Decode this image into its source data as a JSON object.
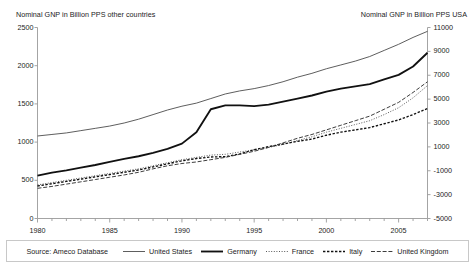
{
  "titles": {
    "left": "Nominal GNP in Billion PPS other countries",
    "right": "Nominal GNP in Billion PPS USA"
  },
  "source_label": "Source: Ameco Database",
  "axes": {
    "left_ticks": [
      "2500",
      "2000",
      "1500",
      "1000",
      "500",
      "0"
    ],
    "right_ticks": [
      "11000",
      "9000",
      "7000",
      "5000",
      "3000",
      "1000",
      "-1000",
      "-3000",
      "-5000"
    ],
    "x_ticks": [
      "1980",
      "1985",
      "1990",
      "1995",
      "2000",
      "2005"
    ]
  },
  "legend": [
    {
      "label": "United States",
      "style": "solid-thin"
    },
    {
      "label": "Germany",
      "style": "solid-thick"
    },
    {
      "label": "France",
      "style": "dotted"
    },
    {
      "label": "Italy",
      "style": "dash-dot"
    },
    {
      "label": "United Kingdom",
      "style": "dashed"
    }
  ],
  "chart_data": {
    "type": "line",
    "xlabel": "",
    "ylabel": "Nominal GNP in Billion PPS other countries",
    "ylabel_secondary": "Nominal GNP in Billion PPS USA",
    "grid": false,
    "legend_position": "bottom",
    "xlim": [
      1980,
      2007
    ],
    "ylim": [
      0,
      2500
    ],
    "ylim_secondary": [
      -5000,
      11000
    ],
    "x": [
      1980,
      1981,
      1982,
      1983,
      1984,
      1985,
      1986,
      1987,
      1988,
      1989,
      1990,
      1991,
      1992,
      1993,
      1994,
      1995,
      1996,
      1997,
      1998,
      1999,
      2000,
      2001,
      2002,
      2003,
      2004,
      2005,
      2006,
      2007
    ],
    "series": [
      {
        "name": "United States",
        "axis": "secondary",
        "values": [
          1920,
          2060,
          2180,
          2300,
          2440,
          2580,
          2720,
          2880,
          3060,
          3230,
          3390,
          3520,
          3690,
          3860,
          4080,
          4260,
          4480,
          4720,
          5000,
          5280,
          5600,
          5780,
          6020,
          6320,
          6720,
          7160,
          7620,
          8060
        ],
        "axis_note": "right scale"
      },
      {
        "name": "United States",
        "axis": "primary_equivalent",
        "values": [
          1080,
          1100,
          1120,
          1150,
          1180,
          1210,
          1250,
          1300,
          1360,
          1420,
          1470,
          1510,
          1570,
          1630,
          1670,
          1700,
          1740,
          1790,
          1850,
          1900,
          1960,
          2010,
          2060,
          2120,
          2200,
          2280,
          2370,
          2450
        ]
      },
      {
        "name": "Germany",
        "axis": "primary",
        "values": [
          560,
          600,
          630,
          665,
          700,
          740,
          780,
          815,
          860,
          910,
          980,
          1130,
          1430,
          1480,
          1480,
          1470,
          1490,
          1530,
          1570,
          1610,
          1660,
          1700,
          1730,
          1760,
          1820,
          1880,
          1990,
          2170
        ]
      },
      {
        "name": "France",
        "axis": "primary",
        "values": [
          440,
          470,
          500,
          530,
          560,
          590,
          620,
          650,
          690,
          730,
          770,
          800,
          830,
          840,
          870,
          900,
          930,
          970,
          1020,
          1070,
          1130,
          1180,
          1230,
          1280,
          1360,
          1450,
          1580,
          1740
        ]
      },
      {
        "name": "Italy",
        "axis": "primary",
        "values": [
          425,
          455,
          485,
          515,
          545,
          575,
          605,
          635,
          675,
          715,
          755,
          785,
          805,
          810,
          845,
          900,
          940,
          975,
          1010,
          1040,
          1090,
          1130,
          1160,
          1190,
          1240,
          1290,
          1360,
          1440
        ]
      },
      {
        "name": "United Kingdom",
        "axis": "primary",
        "values": [
          395,
          420,
          450,
          480,
          510,
          540,
          570,
          605,
          650,
          690,
          720,
          740,
          770,
          800,
          840,
          880,
          930,
          990,
          1050,
          1100,
          1160,
          1220,
          1280,
          1340,
          1430,
          1520,
          1650,
          1790
        ]
      }
    ]
  }
}
